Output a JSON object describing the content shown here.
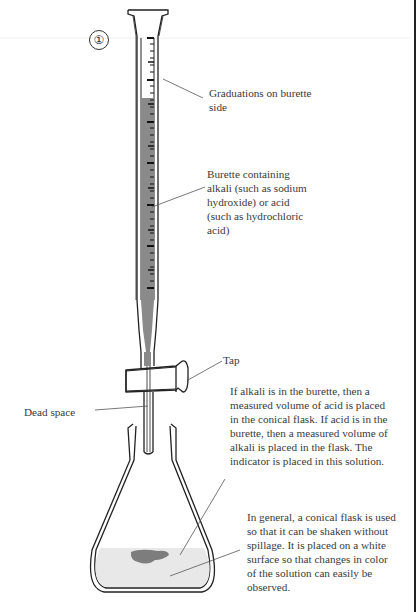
{
  "figure": {
    "number": "1",
    "number_glyph": "①"
  },
  "labels": {
    "graduations": "Graduations on burette side",
    "burette_contents": "Burette containing alkali (such as sodium hydroxide) or acid (such as hydrochloric acid)",
    "tap": "Tap",
    "dead_space": "Dead space",
    "flask_solution": "If alkali is in the burette, then a measured volume of acid is placed in the conical flask. If acid is in the burette, then a measured volume of alkali is placed in the flask. The indicator is placed in this solution.",
    "conical_flask": "In general, a conical flask is used so that it can be shaken without spillage. It is placed on a white surface so that changes in color of the solution can easily be observed."
  },
  "colors": {
    "liquid": "#8a8a8a",
    "solution": "#e8e8e8",
    "indicator": "#6a6a6a",
    "outline": "#222222"
  }
}
